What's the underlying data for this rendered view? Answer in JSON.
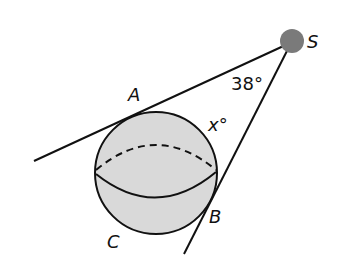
{
  "diagram": {
    "points": {
      "S": "S",
      "A": "A",
      "B": "B",
      "C": "C"
    },
    "angle_known": "38°",
    "angle_unknown": "x°",
    "colors": {
      "sphere_fill": "#d9d9d9",
      "source_fill": "#7a7a7a",
      "line": "#111111"
    }
  }
}
